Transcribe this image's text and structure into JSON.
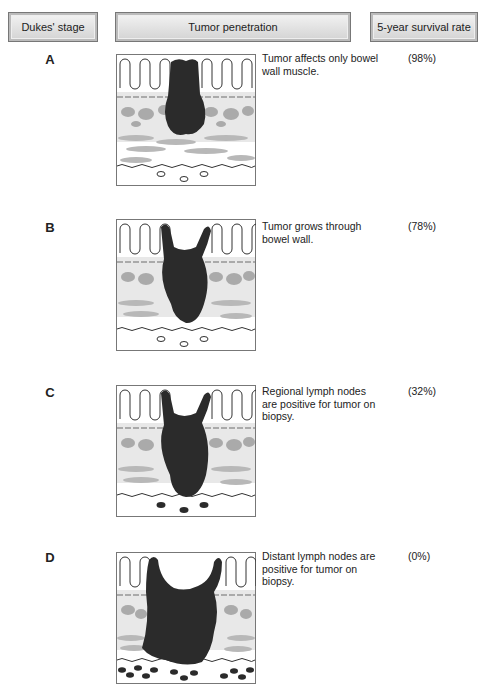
{
  "headers": {
    "stage": "Dukes' stage",
    "penetration": "Tumor penetration",
    "survival": "5-year survival rate"
  },
  "rows": [
    {
      "stage": "A",
      "description": "Tumor affects only bowel wall muscle.",
      "survival": "(98%)"
    },
    {
      "stage": "B",
      "description": "Tumor grows through bowel wall.",
      "survival": "(78%)"
    },
    {
      "stage": "C",
      "description": "Regional lymph nodes are positive for tumor on biopsy.",
      "survival": "(32%)"
    },
    {
      "stage": "D",
      "description": "Distant lymph nodes are positive for tumor on biopsy.",
      "survival": "(0%)"
    }
  ],
  "colors": {
    "tumor": "#2b2b2b",
    "tissue": "#b0b0b0",
    "lightband": "#e6e6e6",
    "border": "#777777"
  }
}
